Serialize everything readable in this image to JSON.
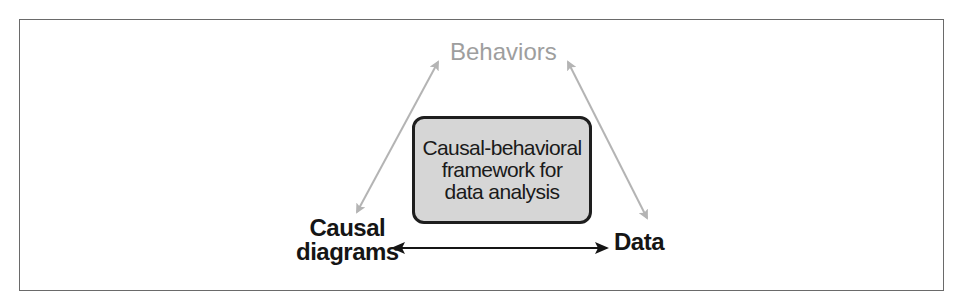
{
  "diagram": {
    "nodes": {
      "top": {
        "label": "Behaviors",
        "color": "#9e9e9e"
      },
      "center": {
        "lines": [
          "Causal-behavioral",
          "framework for",
          "data analysis"
        ],
        "fill": "#d6d6d6",
        "border": "#1e1e1e"
      },
      "bottom_left": {
        "lines": [
          "Causal",
          "diagrams"
        ],
        "color": "#151515"
      },
      "bottom_right": {
        "label": "Data",
        "color": "#151515"
      }
    },
    "edges": [
      {
        "from": "Causal diagrams",
        "to": "Behaviors",
        "direction": "bidirectional",
        "color": "#b4b4b4"
      },
      {
        "from": "Behaviors",
        "to": "Data",
        "direction": "bidirectional",
        "color": "#b4b4b4"
      },
      {
        "from": "Causal diagrams",
        "to": "Data",
        "direction": "bidirectional",
        "color": "#151515"
      }
    ]
  }
}
